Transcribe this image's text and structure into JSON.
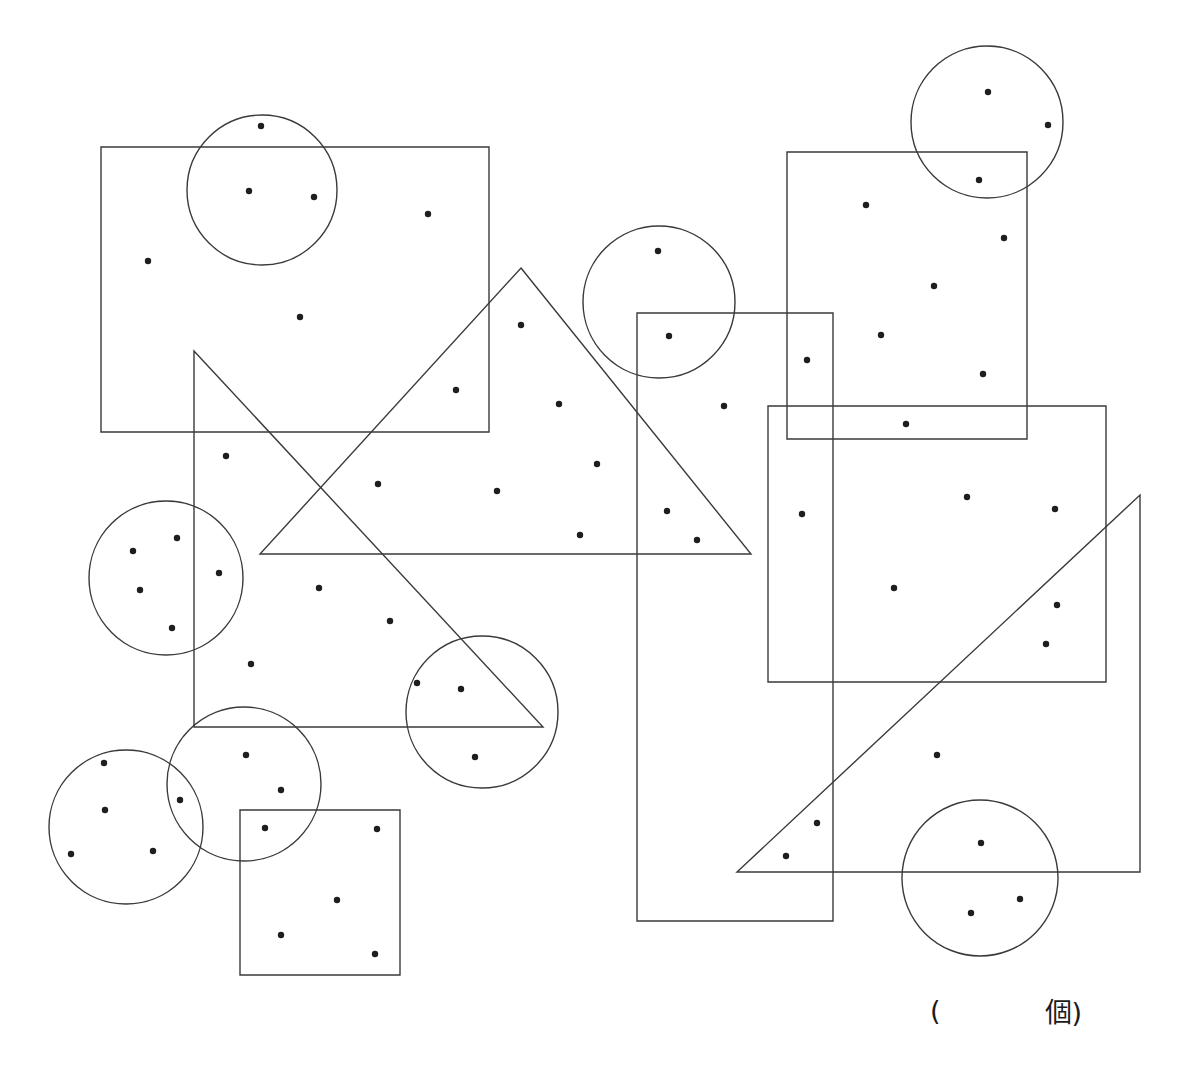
{
  "page": {
    "background_color": "#ffffff",
    "stroke_color": "#3a3a3a",
    "dot_color": "#1e1e1e",
    "width": 1185,
    "height": 1085
  },
  "answer": {
    "paren_open": "(",
    "blank": "",
    "unit_close": "個)",
    "full_text": "(　　　個)"
  },
  "chart_data": {
    "type": "scatter",
    "title": "",
    "subtitle": "",
    "xlabel": "",
    "ylabel": "",
    "xlim": [
      0,
      1185
    ],
    "ylim": [
      0,
      1085
    ],
    "grid": false,
    "legend": null,
    "dot_radius": 3.2,
    "total_dots": 63,
    "points": [
      [
        261,
        126
      ],
      [
        249,
        191
      ],
      [
        314,
        197
      ],
      [
        428,
        214
      ],
      [
        148,
        261
      ],
      [
        300,
        317
      ],
      [
        988,
        92
      ],
      [
        1048,
        125
      ],
      [
        979,
        180
      ],
      [
        866,
        205
      ],
      [
        1004,
        238
      ],
      [
        934,
        286
      ],
      [
        658,
        251
      ],
      [
        669,
        336
      ],
      [
        881,
        335
      ],
      [
        807,
        360
      ],
      [
        983,
        374
      ],
      [
        521,
        325
      ],
      [
        456,
        390
      ],
      [
        559,
        404
      ],
      [
        724,
        406
      ],
      [
        906,
        424
      ],
      [
        226,
        456
      ],
      [
        378,
        484
      ],
      [
        497,
        491
      ],
      [
        597,
        464
      ],
      [
        667,
        511
      ],
      [
        580,
        535
      ],
      [
        697,
        540
      ],
      [
        802,
        514
      ],
      [
        967,
        497
      ],
      [
        1055,
        509
      ],
      [
        133,
        551
      ],
      [
        177,
        538
      ],
      [
        219,
        573
      ],
      [
        140,
        590
      ],
      [
        172,
        628
      ],
      [
        319,
        588
      ],
      [
        390,
        621
      ],
      [
        251,
        664
      ],
      [
        894,
        588
      ],
      [
        1057,
        605
      ],
      [
        1046,
        644
      ],
      [
        417,
        683
      ],
      [
        461,
        689
      ],
      [
        475,
        757
      ],
      [
        246,
        755
      ],
      [
        281,
        790
      ],
      [
        180,
        800
      ],
      [
        104,
        763
      ],
      [
        105,
        810
      ],
      [
        153,
        851
      ],
      [
        71,
        854
      ],
      [
        265,
        828
      ],
      [
        377,
        829
      ],
      [
        337,
        900
      ],
      [
        281,
        935
      ],
      [
        375,
        954
      ],
      [
        937,
        755
      ],
      [
        817,
        823
      ],
      [
        786,
        856
      ],
      [
        981,
        843
      ],
      [
        1020,
        899
      ],
      [
        971,
        913
      ]
    ],
    "shapes": [
      {
        "kind": "rect",
        "name": "rect-top-left",
        "x": 101,
        "y": 147,
        "w": 388,
        "h": 285
      },
      {
        "kind": "rect",
        "name": "rect-bottom-left-square",
        "x": 240,
        "y": 810,
        "w": 160,
        "h": 165
      },
      {
        "kind": "rect",
        "name": "rect-top-right",
        "x": 787,
        "y": 152,
        "w": 240,
        "h": 287
      },
      {
        "kind": "rect",
        "name": "rect-tall-narrow-center",
        "x": 637,
        "y": 313,
        "w": 196,
        "h": 608
      },
      {
        "kind": "rect",
        "name": "rect-right-large",
        "x": 768,
        "y": 406,
        "w": 338,
        "h": 276
      },
      {
        "kind": "circle",
        "name": "circle-top-left",
        "cx": 262,
        "cy": 190,
        "r": 75
      },
      {
        "kind": "circle",
        "name": "circle-left-middle",
        "cx": 166,
        "cy": 578,
        "r": 77
      },
      {
        "kind": "circle",
        "name": "circle-bottom-left-outer",
        "cx": 126,
        "cy": 827,
        "r": 77
      },
      {
        "kind": "circle",
        "name": "circle-bottom-left-inner",
        "cx": 244,
        "cy": 784,
        "r": 77
      },
      {
        "kind": "circle",
        "name": "circle-center-lower",
        "cx": 482,
        "cy": 712,
        "r": 76
      },
      {
        "kind": "circle",
        "name": "circle-center-upper",
        "cx": 659,
        "cy": 302,
        "r": 76
      },
      {
        "kind": "circle",
        "name": "circle-top-right",
        "cx": 987,
        "cy": 122,
        "r": 76
      },
      {
        "kind": "circle",
        "name": "circle-bottom-right",
        "cx": 980,
        "cy": 878,
        "r": 78
      },
      {
        "kind": "triangle",
        "name": "triangle-center-up",
        "points": "521,268 751,554 260,554"
      },
      {
        "kind": "triangle",
        "name": "triangle-center-down",
        "points": "194,351 543,727 194,727"
      },
      {
        "kind": "triangle",
        "name": "triangle-bottom-right",
        "points": "1140,495 1140,872 737,872"
      }
    ]
  }
}
